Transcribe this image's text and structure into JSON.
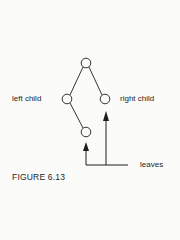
{
  "diagram": {
    "type": "binary-tree",
    "nodes": [
      {
        "id": "root",
        "x": 86,
        "y": 63
      },
      {
        "id": "left-child",
        "x": 67,
        "y": 99
      },
      {
        "id": "right-child",
        "x": 105,
        "y": 99
      },
      {
        "id": "leaf-bottom",
        "x": 86,
        "y": 132
      }
    ],
    "edges": [
      [
        "root",
        "left-child"
      ],
      [
        "root",
        "right-child"
      ],
      [
        "left-child",
        "leaf-bottom"
      ]
    ],
    "labels": {
      "left_child": "left child",
      "right_child": "right child",
      "leaves": "leaves"
    },
    "caption": "FIGURE 6.13",
    "colors": {
      "ink": "#1e1e1e",
      "background": "#fbfbfa"
    }
  }
}
